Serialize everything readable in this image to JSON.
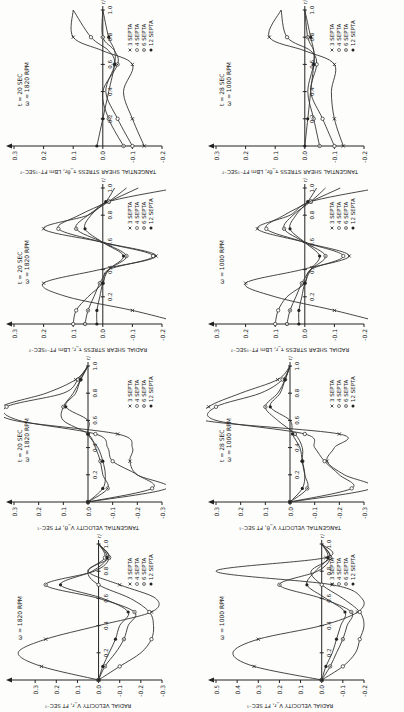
{
  "figure": {
    "orientation": "rotated 90 degrees counterclockwise",
    "legend_entries": [
      "3 SEPTA",
      "4 SEPTA",
      "6 SEPTA",
      "12 SEPTA"
    ],
    "x_axis_label": "r/R",
    "x_ticks": [
      "0.2",
      "0.4",
      "0.6",
      "0.8",
      "1.0"
    ]
  },
  "chart_data": [
    {
      "id": "radial-velocity-1820",
      "type": "line",
      "title": "",
      "annotation": "ω = 1820 RPM",
      "xlabel": "r/R",
      "ylabel": "RADIAL VELOCITY V_r, FT SEC⁻¹",
      "ylim": [
        -0.3,
        0.4
      ],
      "yticks": [
        "0.3",
        "0.2",
        "0.1",
        "0.0",
        "-0.1",
        "-0.2",
        "-0.3"
      ],
      "x": [
        0.0,
        0.1,
        0.2,
        0.3,
        0.4,
        0.5,
        0.6,
        0.7,
        0.8,
        0.9,
        1.0
      ],
      "series": [
        {
          "name": "3 SEPTA",
          "values": [
            0.0,
            0.27,
            0.38,
            0.25,
            0.0,
            -0.25,
            -0.27,
            -0.1,
            0.05,
            -0.05,
            0.0
          ]
        },
        {
          "name": "4 SEPTA",
          "values": [
            0.0,
            -0.1,
            -0.2,
            -0.25,
            -0.26,
            -0.24,
            -0.15,
            0.0,
            0.05,
            -0.03,
            0.0
          ]
        },
        {
          "name": "6 SEPTA",
          "values": [
            0.0,
            -0.03,
            -0.08,
            -0.12,
            -0.14,
            -0.17,
            0.0,
            0.25,
            0.02,
            -0.05,
            0.0
          ]
        },
        {
          "name": "12 SEPTA",
          "values": [
            0.0,
            -0.02,
            -0.05,
            -0.08,
            -0.1,
            -0.14,
            -0.02,
            0.18,
            0.03,
            -0.04,
            0.0
          ]
        }
      ]
    },
    {
      "id": "tangential-velocity-1820",
      "type": "line",
      "annotation": "t = 20 SEC, ω = 1820 RPM",
      "xlabel": "r/R",
      "ylabel": "TANGENTIAL VELOCITY V_θ, FT SEC⁻¹",
      "ylim": [
        -0.3,
        0.3
      ],
      "yticks": [
        "0.3",
        "0.2",
        "0.1",
        "0.0",
        "-0.1",
        "-0.2",
        "-0.3"
      ],
      "x": [
        0.0,
        0.1,
        0.2,
        0.3,
        0.4,
        0.5,
        0.6,
        0.7,
        0.8,
        0.9,
        1.0
      ],
      "series": [
        {
          "name": "3 SEPTA",
          "values": [
            0.0,
            -0.32,
            -0.2,
            -0.17,
            -0.18,
            -0.12,
            0.3,
            0.35,
            0.17,
            0.05,
            0.0
          ]
        },
        {
          "name": "4 SEPTA",
          "values": [
            0.0,
            -0.26,
            -0.2,
            -0.1,
            -0.08,
            -0.03,
            0.28,
            0.33,
            0.1,
            0.04,
            0.0
          ]
        },
        {
          "name": "6 SEPTA",
          "values": [
            0.0,
            -0.08,
            -0.06,
            -0.05,
            -0.03,
            0.0,
            0.1,
            0.1,
            0.06,
            0.03,
            0.0
          ]
        },
        {
          "name": "12 SEPTA",
          "values": [
            0.0,
            -0.06,
            -0.07,
            -0.06,
            -0.04,
            0.0,
            0.0,
            0.09,
            0.05,
            0.03,
            0.0
          ]
        }
      ]
    },
    {
      "id": "radial-shear-1820",
      "type": "line",
      "annotation": "t = 20 SEC, ω = 1820 RPM",
      "xlabel": "r/R",
      "ylabel": "RADIAL SHEAR STRESS τ_r, LBm FT⁻¹SEC⁻²",
      "ylim": [
        -0.2,
        0.3
      ],
      "yticks": [
        "0.3",
        "0.2",
        "0.1",
        "0.0",
        "-0.1",
        "-0.2"
      ],
      "x": [
        0.0,
        0.1,
        0.2,
        0.3,
        0.4,
        0.5,
        0.6,
        0.7,
        0.8,
        0.9,
        1.0
      ],
      "series": [
        {
          "name": "3 SEPTA",
          "values": [
            -0.28,
            -0.1,
            0.12,
            0.2,
            0.01,
            -0.18,
            0.0,
            0.2,
            0.05,
            -0.02,
            -0.25
          ]
        },
        {
          "name": "4 SEPTA",
          "values": [
            0.1,
            0.09,
            0.05,
            0.0,
            -0.02,
            -0.17,
            0.0,
            0.15,
            0.08,
            -0.02,
            -0.12
          ]
        },
        {
          "name": "6 SEPTA",
          "values": [
            0.06,
            0.05,
            0.03,
            0.01,
            -0.02,
            -0.08,
            0.0,
            0.09,
            0.05,
            -0.02,
            -0.08
          ]
        },
        {
          "name": "12 SEPTA",
          "values": [
            0.02,
            0.02,
            0.01,
            0.0,
            -0.02,
            -0.07,
            0.0,
            0.06,
            0.04,
            -0.01,
            -0.04
          ]
        }
      ]
    },
    {
      "id": "tangential-shear-1820",
      "type": "line",
      "annotation": "t = 20 SEC, ω = 1820 RPM",
      "xlabel": "r/R",
      "ylabel": "TANGENTIAL SHEAR STRESS τ_θr, LBm FT⁻¹SEC⁻²",
      "ylim": [
        -0.2,
        0.3
      ],
      "yticks": [
        "0.3",
        "0.2",
        "0.1",
        "0.0",
        "-0.1",
        "-0.2"
      ],
      "x": [
        0.0,
        0.2,
        0.4,
        0.6,
        0.7,
        0.8,
        1.0
      ],
      "series": [
        {
          "name": "3 SEPTA",
          "values": [
            -0.14,
            -0.1,
            -0.07,
            -0.1,
            0.0,
            0.1,
            0.1
          ]
        },
        {
          "name": "4 SEPTA",
          "values": [
            -0.1,
            -0.05,
            -0.01,
            -0.04,
            -0.02,
            0.04,
            0.1
          ]
        },
        {
          "name": "6 SEPTA",
          "values": [
            -0.07,
            -0.02,
            0.0,
            -0.05,
            -0.04,
            0.0,
            0.0
          ]
        },
        {
          "name": "12 SEPTA",
          "values": [
            0.02,
            0.0,
            -0.02,
            -0.04,
            -0.04,
            -0.02,
            0.0
          ]
        }
      ]
    },
    {
      "id": "radial-velocity-1000",
      "type": "line",
      "annotation": "ω = 1000 RPM",
      "xlabel": "r/R",
      "ylabel": "RADIAL VELOCITY V_r, FT SEC⁻¹",
      "ylim": [
        -0.2,
        0.5
      ],
      "yticks": [
        "0.5",
        "0.4",
        "0.3",
        "0.2",
        "0.1",
        "0.0",
        "-0.1",
        "-0.2"
      ],
      "x": [
        0.0,
        0.1,
        0.2,
        0.3,
        0.4,
        0.5,
        0.6,
        0.7,
        0.8,
        0.9,
        1.0
      ],
      "series": [
        {
          "name": "3 SEPTA",
          "values": [
            0.0,
            0.32,
            0.42,
            0.3,
            0.0,
            -0.17,
            -0.19,
            -0.05,
            0.5,
            -0.02,
            0.0
          ]
        },
        {
          "name": "4 SEPTA",
          "values": [
            0.0,
            -0.1,
            -0.16,
            -0.18,
            -0.2,
            -0.18,
            -0.1,
            0.0,
            0.05,
            -0.04,
            0.0
          ]
        },
        {
          "name": "6 SEPTA",
          "values": [
            0.0,
            -0.04,
            -0.07,
            -0.1,
            -0.12,
            -0.14,
            0.0,
            0.2,
            0.02,
            -0.04,
            0.0
          ]
        },
        {
          "name": "12 SEPTA",
          "values": [
            0.0,
            -0.02,
            -0.05,
            -0.07,
            -0.09,
            -0.11,
            -0.02,
            0.07,
            0.03,
            -0.03,
            0.0
          ]
        }
      ]
    },
    {
      "id": "tangential-velocity-1000",
      "type": "line",
      "annotation": "t = 28 SEC, ω = 1000 RPM",
      "xlabel": "r/R",
      "ylabel": "TANGENTIAL VELOCITY V_θ, FT SEC⁻¹",
      "ylim": [
        -0.3,
        0.3
      ],
      "yticks": [
        "0.3",
        "0.2",
        "0.1",
        "0.0",
        "-0.1",
        "-0.2",
        "-0.3"
      ],
      "x": [
        0.0,
        0.1,
        0.2,
        0.3,
        0.4,
        0.5,
        0.6,
        0.7,
        0.8,
        0.9,
        1.0
      ],
      "series": [
        {
          "name": "3 SEPTA",
          "values": [
            0.0,
            -0.33,
            -0.22,
            -0.15,
            -0.18,
            -0.2,
            0.35,
            0.33,
            0.2,
            0.05,
            0.0
          ]
        },
        {
          "name": "4 SEPTA",
          "values": [
            0.0,
            -0.25,
            -0.2,
            -0.14,
            -0.1,
            -0.06,
            0.3,
            0.3,
            0.12,
            0.03,
            0.0
          ]
        },
        {
          "name": "6 SEPTA",
          "values": [
            0.0,
            -0.07,
            -0.06,
            -0.05,
            -0.05,
            -0.02,
            0.05,
            0.1,
            0.05,
            0.02,
            0.0
          ]
        },
        {
          "name": "12 SEPTA",
          "values": [
            0.0,
            -0.05,
            -0.06,
            -0.05,
            -0.04,
            -0.01,
            0.0,
            0.08,
            0.04,
            0.02,
            0.0
          ]
        }
      ]
    },
    {
      "id": "radial-shear-1000",
      "type": "line",
      "annotation": "ω = 1000 RPM",
      "xlabel": "r/R",
      "ylabel": "RADIAL SHEAR STRESS τ_r, LBm FT⁻¹SEC⁻²",
      "ylim": [
        -0.2,
        0.3
      ],
      "yticks": [
        "0.3",
        "0.2",
        "0.1",
        "0.0",
        "-0.1",
        "-0.2"
      ],
      "x": [
        0.0,
        0.1,
        0.2,
        0.3,
        0.4,
        0.5,
        0.6,
        0.7,
        0.8,
        0.9,
        1.0
      ],
      "series": [
        {
          "name": "3 SEPTA",
          "values": [
            -0.28,
            -0.1,
            0.1,
            0.2,
            0.01,
            -0.15,
            0.0,
            0.16,
            0.05,
            -0.02,
            -0.25
          ]
        },
        {
          "name": "4 SEPTA",
          "values": [
            0.1,
            0.09,
            0.06,
            0.0,
            -0.02,
            -0.13,
            0.0,
            0.13,
            0.07,
            -0.02,
            -0.12
          ]
        },
        {
          "name": "6 SEPTA",
          "values": [
            0.06,
            0.05,
            0.03,
            0.01,
            -0.02,
            -0.07,
            0.0,
            0.07,
            0.04,
            -0.02,
            -0.07
          ]
        },
        {
          "name": "12 SEPTA",
          "values": [
            0.02,
            0.02,
            0.01,
            0.0,
            -0.02,
            -0.05,
            0.0,
            0.05,
            0.03,
            -0.01,
            -0.04
          ]
        }
      ]
    },
    {
      "id": "tangential-shear-1000",
      "type": "line",
      "annotation": "t = 28 SEC, ω = 1000 RPM",
      "xlabel": "r/R",
      "ylabel": "TANGENTIAL SHEAR STRESS τ_θr, LBm FT⁻¹SEC⁻²",
      "ylim": [
        -0.2,
        0.3
      ],
      "yticks": [
        "0.3",
        "0.2",
        "0.1",
        "0.0",
        "-0.1",
        "-0.2"
      ],
      "x": [
        0.0,
        0.2,
        0.4,
        0.6,
        0.7,
        0.8,
        1.0
      ],
      "series": [
        {
          "name": "3 SEPTA",
          "values": [
            -0.13,
            -0.1,
            -0.09,
            -0.1,
            0.0,
            0.12,
            0.08
          ]
        },
        {
          "name": "4 SEPTA",
          "values": [
            -0.1,
            -0.06,
            -0.02,
            -0.04,
            -0.02,
            0.06,
            0.08
          ]
        },
        {
          "name": "6 SEPTA",
          "values": [
            -0.05,
            -0.03,
            -0.01,
            -0.03,
            -0.03,
            -0.01,
            0.0
          ]
        },
        {
          "name": "12 SEPTA",
          "values": [
            0.0,
            -0.01,
            -0.02,
            -0.03,
            -0.03,
            -0.02,
            0.0
          ]
        }
      ]
    }
  ]
}
